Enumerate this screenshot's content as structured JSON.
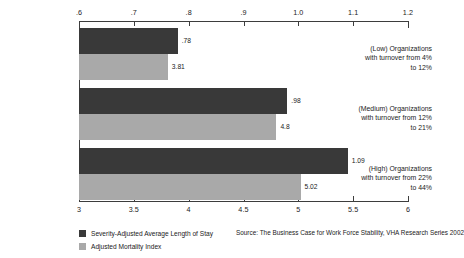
{
  "chart_data": {
    "type": "bar",
    "orientation": "horizontal",
    "title": "",
    "categories": [
      "(Low) Organizations with turnover from 4% to 12%",
      "(Medium) Organizations with turnover from 12% to 21%",
      "(High) Organizations with turnover from 22% to 44%"
    ],
    "series": [
      {
        "name": "Severity-Adjusted Average Length of Stay",
        "color": "#393939",
        "axis": "top",
        "values": [
          0.78,
          0.98,
          1.09
        ],
        "value_labels": [
          ".78",
          ".98",
          "1.09"
        ]
      },
      {
        "name": "Adjusted Mortality Index",
        "color": "#a9a9a9",
        "axis": "bottom",
        "values": [
          3.81,
          4.8,
          5.02
        ],
        "value_labels": [
          "3.81",
          "4.8",
          "5.02"
        ]
      }
    ],
    "top_axis": {
      "label": "",
      "min": 0.6,
      "max": 1.2,
      "ticks": [
        0.6,
        0.7,
        0.8,
        0.9,
        1.0,
        1.1,
        1.2
      ],
      "tick_labels": [
        ".6",
        ".7",
        ".8",
        ".9",
        "1.0",
        "1.1",
        "1.2"
      ]
    },
    "bottom_axis": {
      "label": "",
      "min": 3,
      "max": 6,
      "ticks": [
        3,
        3.5,
        4,
        4.5,
        5,
        5.5,
        6
      ],
      "tick_labels": [
        "3",
        "3.5",
        "4",
        "4.5",
        "5",
        "5.5",
        "6"
      ]
    },
    "grid": false,
    "legend_position": "bottom-left",
    "source": "Source: The Business Case for Work Force Stability, VHA Research Series 2002"
  },
  "legend": {
    "items": [
      {
        "label": "Severity-Adjusted Average Length of Stay",
        "swatch": "dark"
      },
      {
        "label": "Adjusted Mortality Index",
        "swatch": "light"
      }
    ]
  }
}
